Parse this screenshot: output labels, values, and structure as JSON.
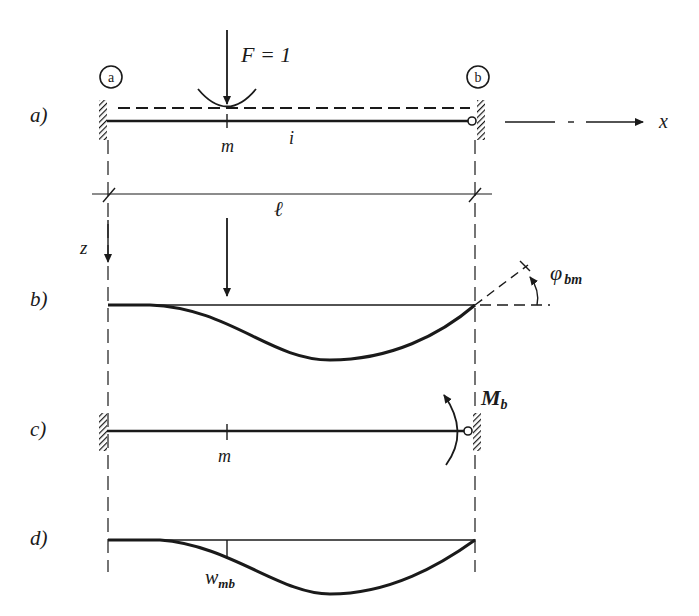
{
  "figure": {
    "colors": {
      "ink": "#1a1a1a",
      "background": "#ffffff"
    }
  },
  "panels": {
    "a": {
      "label": "a)",
      "load_label": "F = 1",
      "node_left": "a",
      "node_right": "b",
      "point_label": "m",
      "member_label": "i",
      "axis_x_label": "x"
    },
    "dimension": {
      "span_label": "ℓ",
      "axis_z_label": "z"
    },
    "b": {
      "label": "b)",
      "rotation_label": "φ",
      "rotation_sub": "bm"
    },
    "c": {
      "label": "c)",
      "moment_label": "M",
      "moment_sub": "b",
      "point_label": "m"
    },
    "d": {
      "label": "d)",
      "deflection_label": "w",
      "deflection_sub": "mb"
    }
  }
}
